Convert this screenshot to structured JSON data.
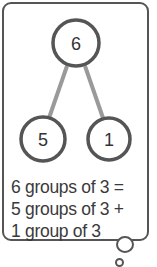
{
  "diagram": {
    "type": "number-bond",
    "whole": "6",
    "parts": [
      "5",
      "1"
    ],
    "colors": {
      "circle_stroke": "#555555",
      "connector": "#999999",
      "text": "#333333"
    }
  },
  "caption": {
    "lines": [
      "6 groups of 3 =",
      "5 groups of 3 +",
      "1 group of 3"
    ]
  }
}
